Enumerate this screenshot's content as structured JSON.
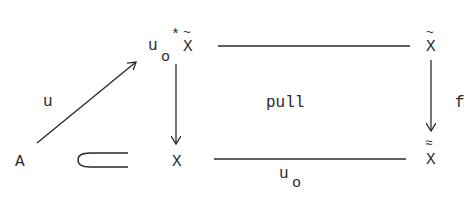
{
  "diagram": {
    "type": "commutative-diagram",
    "style": "typewritten",
    "nodes": {
      "A": {
        "label": "A"
      },
      "pullback": {
        "base": "u",
        "subscript": "o",
        "star": "*",
        "object": "X",
        "accent": "~"
      },
      "X": {
        "label": "X"
      },
      "X_tilde": {
        "object": "X",
        "accent": "~"
      },
      "X_double_tilde": {
        "object": "X",
        "accent": "≈"
      }
    },
    "edges": {
      "u": {
        "label": "u",
        "from": "A",
        "to": "u_o*X̃"
      },
      "inclusion": {
        "label": "⊂",
        "from": "A",
        "to": "X"
      },
      "left_vertical": {
        "from": "u_o*X̃",
        "to": "X"
      },
      "top_horizontal": {
        "from": "u_o*X̃",
        "to": "X̃"
      },
      "f": {
        "label": "f",
        "from": "X̃",
        "to": "X̰"
      },
      "bottom": {
        "base": "u",
        "subscript": "o",
        "from": "X",
        "to": "X≈"
      }
    },
    "center_label": "pull"
  }
}
